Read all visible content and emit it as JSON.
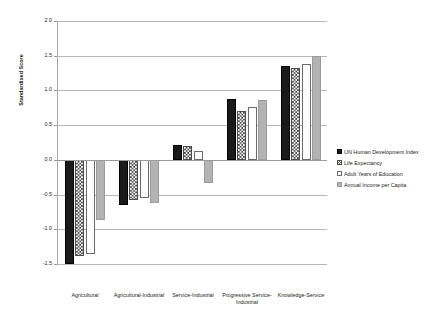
{
  "chart_data": {
    "type": "bar",
    "title": "",
    "subtitle": "",
    "xlabel": "",
    "ylabel": "Standardised Score",
    "ylim": [
      -1.5,
      2.0
    ],
    "ytick_labels": [
      "2.0",
      "1.5",
      "1.0",
      "0.5",
      "0.0",
      "-0.5",
      "-1.0",
      "-1.5"
    ],
    "ytick_values": [
      2.0,
      1.5,
      1.0,
      0.5,
      0.0,
      -0.5,
      -1.0,
      -1.5
    ],
    "grid": true,
    "legend_position": "right",
    "categories": [
      "Agricultural",
      "Agricultural-Industrial",
      "Service-Industrial",
      "Progressive Service-Industrial",
      "Knowledge-Service"
    ],
    "series": [
      {
        "name": "UN Human Development Index",
        "fill": "solid-black",
        "color": "#1a1a1a",
        "values": [
          -1.5,
          -0.65,
          0.21,
          0.87,
          1.35
        ]
      },
      {
        "name": "Life Expectancy",
        "fill": "checkered",
        "color": "#3a3a3a",
        "values": [
          -1.38,
          -0.58,
          0.2,
          0.7,
          1.33
        ]
      },
      {
        "name": "Adult Years of Education",
        "fill": "white",
        "color": "#ffffff",
        "values": [
          -1.35,
          -0.55,
          0.13,
          0.76,
          1.38
        ]
      },
      {
        "name": "Annual Income per Capita",
        "fill": "grey",
        "color": "#b3b3b3",
        "values": [
          -0.87,
          -0.62,
          -0.33,
          0.86,
          1.5
        ]
      }
    ]
  },
  "axis": {
    "ylabel": "Standardised Score"
  },
  "legend": {
    "items": [
      "UN Human Development Index",
      "Life Expectancy",
      "Adult Years of Education",
      "Annual Income per Capita"
    ]
  }
}
